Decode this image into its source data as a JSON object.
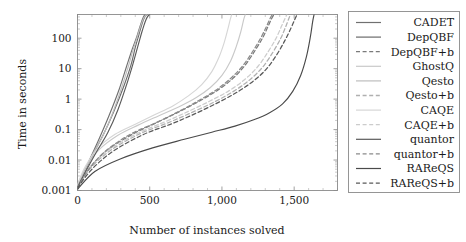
{
  "chart_data": {
    "type": "line",
    "title": "",
    "xlabel": "Number of instances solved",
    "ylabel": "Time in seconds",
    "xlim": [
      0,
      1800
    ],
    "ylim": [
      0.001,
      600
    ],
    "yscale": "log",
    "xscale": "linear",
    "grid": false,
    "legend_position": "right-outside",
    "xticks": [
      0,
      500,
      1000,
      1500
    ],
    "xticklabels": [
      "0",
      "500",
      "1,000",
      "1,500"
    ],
    "yticks": [
      0.001,
      0.01,
      0.1,
      1,
      10,
      100
    ],
    "yticklabels": [
      "0.001",
      "0.01",
      "0.1",
      "1",
      "10",
      "100"
    ],
    "series": [
      {
        "name": "CADET",
        "style": "solid",
        "color": "#707070",
        "x": [
          0,
          40,
          90,
          150,
          220,
          290,
          340,
          380,
          410,
          430,
          445,
          455,
          462,
          468
        ],
        "y": [
          0.0011,
          0.0035,
          0.012,
          0.05,
          0.3,
          2.2,
          12,
          45,
          110,
          220,
          360,
          480,
          550,
          600
        ]
      },
      {
        "name": "DepQBF",
        "style": "solid",
        "color": "#6b6b6b",
        "x": [
          0,
          50,
          110,
          180,
          250,
          320,
          370,
          400,
          425,
          442,
          455,
          466,
          474,
          480
        ],
        "y": [
          0.0012,
          0.004,
          0.016,
          0.07,
          0.38,
          2.6,
          13,
          50,
          130,
          250,
          390,
          500,
          560,
          600
        ]
      },
      {
        "name": "DepQBF+b",
        "style": "dashed",
        "color": "#7a7a7a",
        "x": [
          0,
          80,
          200,
          380,
          560,
          720,
          860,
          980,
          1080,
          1160,
          1230,
          1285,
          1320,
          1345,
          1360
        ],
        "y": [
          0.0013,
          0.005,
          0.02,
          0.07,
          0.18,
          0.42,
          0.95,
          2.1,
          5.0,
          13,
          40,
          110,
          250,
          450,
          600
        ]
      },
      {
        "name": "GhostQ",
        "style": "solid",
        "color": "#c9c9c9",
        "x": [
          0,
          60,
          150,
          280,
          420,
          560,
          700,
          820,
          920,
          1000,
          1060,
          1100,
          1130,
          1150,
          1162
        ],
        "y": [
          0.0015,
          0.006,
          0.022,
          0.065,
          0.14,
          0.28,
          0.55,
          1.1,
          2.4,
          6.0,
          18,
          55,
          160,
          400,
          600
        ]
      },
      {
        "name": "Qesto",
        "style": "solid",
        "color": "#bdbdbd",
        "x": [
          0,
          45,
          100,
          170,
          240,
          300,
          350,
          385,
          412,
          432,
          448,
          460,
          470,
          478
        ],
        "y": [
          0.0011,
          0.0038,
          0.014,
          0.055,
          0.32,
          2.0,
          11,
          42,
          105,
          215,
          350,
          470,
          545,
          600
        ]
      },
      {
        "name": "Qesto+b",
        "style": "dashed",
        "color": "#b0b0b0",
        "x": [
          0,
          90,
          230,
          430,
          630,
          800,
          950,
          1080,
          1190,
          1280,
          1350,
          1405,
          1440,
          1462,
          1475
        ],
        "y": [
          0.0014,
          0.0055,
          0.021,
          0.072,
          0.17,
          0.38,
          0.82,
          1.8,
          4.2,
          11,
          33,
          95,
          230,
          430,
          600
        ]
      },
      {
        "name": "CAQE",
        "style": "solid",
        "color": "#d6d6d6",
        "x": [
          0,
          55,
          140,
          260,
          400,
          530,
          660,
          770,
          860,
          930,
          980,
          1015,
          1040,
          1058,
          1068
        ],
        "y": [
          0.0016,
          0.0062,
          0.024,
          0.07,
          0.15,
          0.3,
          0.6,
          1.3,
          3.0,
          8.0,
          24,
          70,
          190,
          420,
          600
        ]
      },
      {
        "name": "CAQE+b",
        "style": "dashed",
        "color": "#cccccc",
        "x": [
          0,
          85,
          220,
          410,
          600,
          770,
          920,
          1050,
          1160,
          1250,
          1320,
          1375,
          1412,
          1436,
          1450
        ],
        "y": [
          0.0015,
          0.0058,
          0.022,
          0.073,
          0.175,
          0.4,
          0.88,
          1.9,
          4.5,
          12,
          36,
          100,
          245,
          440,
          600
        ]
      },
      {
        "name": "quantor",
        "style": "solid",
        "color": "#5a5a5a",
        "x": [
          0,
          60,
          130,
          210,
          280,
          340,
          385,
          418,
          442,
          460,
          474,
          485,
          493,
          499
        ],
        "y": [
          0.0013,
          0.0045,
          0.018,
          0.08,
          0.45,
          3.0,
          15,
          55,
          140,
          265,
          405,
          510,
          565,
          600
        ]
      },
      {
        "name": "quantor+b",
        "style": "dashed",
        "color": "#8a8a8a",
        "x": [
          0,
          75,
          190,
          360,
          540,
          700,
          840,
          960,
          1060,
          1145,
          1215,
          1270,
          1308,
          1333,
          1348
        ],
        "y": [
          0.0012,
          0.0048,
          0.019,
          0.068,
          0.165,
          0.39,
          0.9,
          2.0,
          4.8,
          12.5,
          38,
          105,
          240,
          440,
          600
        ]
      },
      {
        "name": "RAReQS",
        "style": "solid",
        "color": "#4a4a4a",
        "x": [
          0,
          120,
          300,
          520,
          740,
          930,
          1090,
          1220,
          1330,
          1420,
          1490,
          1545,
          1585,
          1612,
          1628,
          1638
        ],
        "y": [
          0.0011,
          0.0042,
          0.011,
          0.025,
          0.048,
          0.082,
          0.13,
          0.21,
          0.36,
          0.7,
          1.8,
          6.0,
          25,
          110,
          350,
          600
        ]
      },
      {
        "name": "RAReQS+b",
        "style": "dashed",
        "color": "#595959",
        "x": [
          0,
          100,
          250,
          460,
          660,
          830,
          980,
          1110,
          1220,
          1310,
          1382,
          1438,
          1478,
          1504,
          1520
        ],
        "y": [
          0.0012,
          0.005,
          0.02,
          0.07,
          0.16,
          0.36,
          0.8,
          1.75,
          4.0,
          10,
          30,
          88,
          215,
          410,
          600
        ]
      }
    ]
  },
  "legend": {
    "entries": [
      {
        "label": "CADET"
      },
      {
        "label": "DepQBF"
      },
      {
        "label": "DepQBF+b"
      },
      {
        "label": "GhostQ"
      },
      {
        "label": "Qesto"
      },
      {
        "label": "Qesto+b"
      },
      {
        "label": "CAQE"
      },
      {
        "label": "CAQE+b"
      },
      {
        "label": "quantor"
      },
      {
        "label": "quantor+b"
      },
      {
        "label": "RAReQS"
      },
      {
        "label": "RAReQS+b"
      }
    ]
  }
}
